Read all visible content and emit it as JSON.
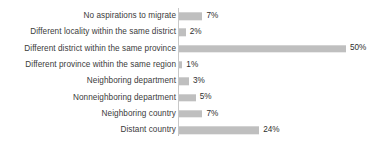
{
  "chart_data": {
    "type": "bar",
    "orientation": "horizontal",
    "title": "",
    "subtitle": "",
    "xlabel": "",
    "ylabel": "",
    "xlim": [
      0,
      50
    ],
    "grid": false,
    "legend": false,
    "value_suffix": "%",
    "bar_color": "#bfbfbf",
    "axis_color": "#c8c8c8",
    "label_color": "#3b3b3b",
    "categories": [
      "No aspirations to migrate",
      "Different locality within the same district",
      "Different district within the same province",
      "Different province within the same region",
      "Neighboring department",
      "Nonneighboring department",
      "Neighboring country",
      "Distant country"
    ],
    "values": [
      7,
      2,
      50,
      1,
      3,
      5,
      7,
      24
    ],
    "value_labels": [
      "7%",
      "2%",
      "50%",
      "1%",
      "3%",
      "5%",
      "7%",
      "24%"
    ]
  }
}
